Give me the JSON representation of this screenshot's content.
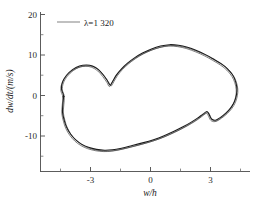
{
  "chart_data": {
    "type": "line",
    "title": "",
    "subtitle": "",
    "xlabel": "w/h",
    "ylabel": "dw/dt/(m/s)",
    "xlim": [
      -4.9,
      4.6
    ],
    "ylim": [
      -16.5,
      21.5
    ],
    "xticks": [
      -3,
      0,
      3
    ],
    "xtick_labels": [
      "-3",
      "0",
      "3"
    ],
    "yticks": [
      -10,
      0,
      10,
      20
    ],
    "ytick_labels": [
      "-10",
      "0",
      "10",
      "20"
    ],
    "grid": false,
    "minor_ticks": true,
    "legend": {
      "position": "upper-left-inside",
      "entries": [
        {
          "label": "λ=1 320",
          "color": "#8c8c8c",
          "style": "solid"
        }
      ]
    },
    "annotations": [],
    "series": [
      {
        "name": "λ=1 320",
        "description": "closed phase-plane limit cycle (multiple nearly coincident orbits)",
        "color": "#1c1c1c",
        "closed": true,
        "points": [
          [
            -4.35,
            0.0
          ],
          [
            -4.45,
            1.6
          ],
          [
            -4.4,
            3.3
          ],
          [
            -4.2,
            5.0
          ],
          [
            -3.9,
            6.4
          ],
          [
            -3.55,
            7.3
          ],
          [
            -3.2,
            7.55
          ],
          [
            -2.9,
            7.3
          ],
          [
            -2.6,
            6.4
          ],
          [
            -2.35,
            5.0
          ],
          [
            -2.15,
            3.6
          ],
          [
            -2.02,
            2.55
          ],
          [
            -1.88,
            3.6
          ],
          [
            -1.7,
            5.1
          ],
          [
            -1.45,
            6.6
          ],
          [
            -1.15,
            8.0
          ],
          [
            -0.8,
            9.3
          ],
          [
            -0.4,
            10.5
          ],
          [
            0.05,
            11.5
          ],
          [
            0.5,
            12.2
          ],
          [
            0.95,
            12.55
          ],
          [
            1.4,
            12.4
          ],
          [
            1.85,
            11.9
          ],
          [
            2.3,
            11.1
          ],
          [
            2.75,
            10.1
          ],
          [
            3.15,
            9.0
          ],
          [
            3.55,
            7.8
          ],
          [
            3.85,
            6.6
          ],
          [
            4.1,
            5.1
          ],
          [
            4.25,
            3.5
          ],
          [
            4.32,
            1.8
          ],
          [
            4.3,
            0.2
          ],
          [
            4.2,
            -1.5
          ],
          [
            4.02,
            -3.0
          ],
          [
            3.78,
            -4.3
          ],
          [
            3.5,
            -5.4
          ],
          [
            3.25,
            -6.1
          ],
          [
            3.05,
            -5.8
          ],
          [
            2.92,
            -4.6
          ],
          [
            2.82,
            -3.95
          ],
          [
            2.62,
            -4.6
          ],
          [
            2.35,
            -5.6
          ],
          [
            2.0,
            -6.7
          ],
          [
            1.6,
            -7.8
          ],
          [
            1.15,
            -8.9
          ],
          [
            0.65,
            -10.0
          ],
          [
            0.15,
            -10.9
          ],
          [
            -0.4,
            -11.7
          ],
          [
            -0.95,
            -12.4
          ],
          [
            -1.45,
            -13.0
          ],
          [
            -1.9,
            -13.4
          ],
          [
            -2.3,
            -13.5
          ],
          [
            -2.7,
            -13.3
          ],
          [
            -3.1,
            -12.8
          ],
          [
            -3.45,
            -12.0
          ],
          [
            -3.75,
            -10.9
          ],
          [
            -4.0,
            -9.5
          ],
          [
            -4.2,
            -7.8
          ],
          [
            -4.32,
            -6.0
          ],
          [
            -4.4,
            -4.1
          ],
          [
            -4.38,
            -2.1
          ],
          [
            -4.35,
            0.0
          ]
        ]
      }
    ]
  },
  "figure": {
    "axis_color": "#4a4a4a",
    "curve_color": "#1c1c1c",
    "legend_sample_color": "#8c8c8c",
    "background": "#ffffff"
  }
}
